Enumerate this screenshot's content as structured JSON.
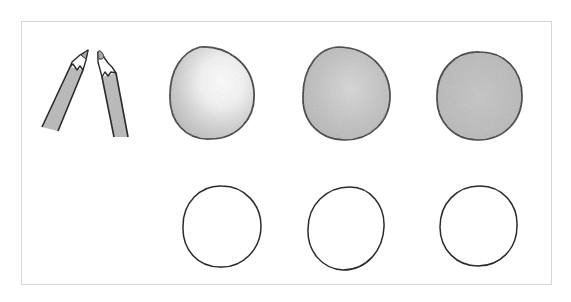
{
  "illustration": {
    "caption": "Shading exercise: two colored pencils, three shaded circles and three empty circles for practice",
    "colors": {
      "outline": "#2b2b2b",
      "frame": "#d6d6d6",
      "pencil_body": "#b9b9b9",
      "pencil_wood": "#ffffff",
      "pencil_lead": "#a8a8a8",
      "shade_light": "#e9e9e9",
      "shade_mid": "#c4c4c4",
      "shade_dark": "#a9a9a9"
    },
    "pencils": [
      {
        "name": "left-pencil",
        "icon": "pencil-icon"
      },
      {
        "name": "right-pencil",
        "icon": "pencil-icon"
      }
    ],
    "shaded_circles": [
      {
        "name": "shaded-circle-light",
        "style": "highlight top-right, shading bottom-left"
      },
      {
        "name": "shaded-circle-medium",
        "style": "even medium shading with highlight"
      },
      {
        "name": "shaded-circle-dark",
        "style": "full even shading"
      }
    ],
    "empty_circles": [
      {
        "name": "practice-circle-1"
      },
      {
        "name": "practice-circle-2"
      },
      {
        "name": "practice-circle-3"
      }
    ]
  }
}
